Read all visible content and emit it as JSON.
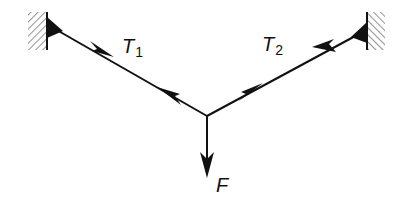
{
  "diagram": {
    "type": "force diagram",
    "colors": {
      "stroke": "#111111",
      "hatch": "#666666",
      "background": "#ffffff"
    },
    "supports": [
      {
        "id": "left-wall",
        "hatch_box": [
          28,
          12,
          19,
          38
        ],
        "anchor": [
          48,
          25
        ]
      },
      {
        "id": "right-wall",
        "hatch_box": [
          367,
          12,
          18,
          38
        ],
        "anchor": [
          366,
          30
        ]
      }
    ],
    "junction": [
      207,
      116
    ],
    "forces": [
      {
        "id": "T1",
        "label_main": "T",
        "label_sub": "1",
        "label_pos": [
          122,
          38
        ],
        "from": "left-wall",
        "to": "junction"
      },
      {
        "id": "T2",
        "label_main": "T",
        "label_sub": "2",
        "label_pos": [
          262,
          36
        ],
        "from": "right-wall",
        "to": "junction"
      },
      {
        "id": "F",
        "label_main": "F",
        "label_sub": "",
        "label_pos": [
          216,
          176
        ],
        "from": "junction",
        "to": [
          207,
          176
        ]
      }
    ]
  }
}
